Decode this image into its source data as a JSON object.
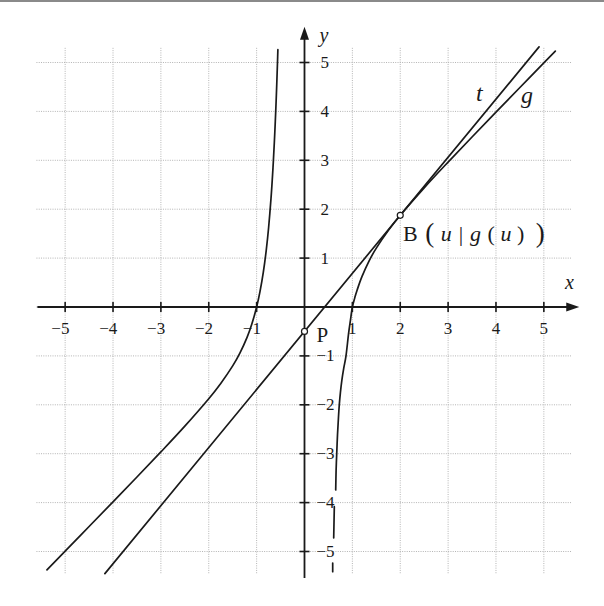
{
  "colors": {
    "ink": "#1a1a1a",
    "grid": "#b4b4b4",
    "background": "#ffffff",
    "border": "#8a8a8a"
  },
  "chart_data": {
    "type": "line",
    "title": "",
    "xlabel": "x",
    "ylabel": "y",
    "xlim": [
      -5.6,
      5.58
    ],
    "ylim": [
      -5.46,
      5.3
    ],
    "grid": true,
    "legend": null,
    "grid_lines": {
      "x": [
        -5,
        -4,
        -3,
        -2,
        -1,
        0,
        1,
        2,
        3,
        4,
        5
      ],
      "y": [
        -5,
        -4,
        -3,
        -2,
        -1,
        0,
        1,
        2,
        3,
        4,
        5
      ]
    },
    "x_axis": {
      "from": -5.58,
      "to": 5.74
    },
    "y_axis": {
      "from": -5.54,
      "to": 5.73
    },
    "x_ticks": {
      "values": [
        -5,
        -4,
        -3,
        -2,
        -1,
        1,
        2,
        3,
        4,
        5
      ],
      "labels": [
        "−5",
        "−4",
        "−3",
        "−2",
        "−1",
        "1",
        "2",
        "3",
        "4",
        "5"
      ]
    },
    "y_ticks": {
      "values": [
        5,
        4,
        3,
        2,
        1,
        -1,
        -2,
        -3,
        -4,
        -5
      ],
      "labels": [
        "5",
        "4",
        "3",
        "2",
        "1",
        "−1",
        "−2",
        "−3",
        "−4",
        "−5"
      ]
    },
    "series": [
      {
        "name": "g",
        "label": "g",
        "style": "solid",
        "branches": [
          [
            [
              -5.38,
              -5.374
            ],
            [
              -5,
              -4.992
            ],
            [
              -4.5,
              -4.489
            ],
            [
              -4,
              -3.984
            ],
            [
              -3.5,
              -3.477
            ],
            [
              -3,
              -2.963
            ],
            [
              -2.5,
              -2.436
            ],
            [
              -2,
              -1.875
            ],
            [
              -1.75,
              -1.563
            ],
            [
              -1.5,
              -1.204
            ],
            [
              -1.35,
              -0.944
            ],
            [
              -1.2,
              -0.621
            ],
            [
              -1.1,
              -0.349
            ],
            [
              -1,
              0
            ],
            [
              -0.93,
              0.313
            ],
            [
              -0.86,
              0.712
            ],
            [
              -0.8,
              1.153
            ],
            [
              -0.75,
              1.62
            ],
            [
              -0.7,
              2.215
            ],
            [
              -0.67,
              2.655
            ],
            [
              -0.65,
              2.991
            ],
            [
              -0.63,
              3.369
            ],
            [
              -0.61,
              3.796
            ],
            [
              -0.595,
              4.152
            ],
            [
              -0.58,
              4.545
            ],
            [
              -0.57,
              4.83
            ],
            [
              -0.562,
              5.072
            ],
            [
              -0.556,
              5.262
            ]
          ],
          [
            [
              0.652,
              -3.74
            ],
            [
              0.66,
              -3.35
            ],
            [
              0.673,
              -3.0
            ],
            [
              0.69,
              -2.6
            ],
            [
              0.71,
              -2.25
            ],
            [
              0.727,
              -2.0
            ],
            [
              0.75,
              -1.75
            ],
            [
              0.78,
              -1.5
            ],
            [
              0.82,
              -1.25
            ],
            [
              0.867,
              -1.0
            ],
            [
              0.92,
              -0.55
            ],
            [
              0.96,
              -0.27
            ],
            [
              1.0,
              0
            ],
            [
              1.05,
              0.187
            ],
            [
              1.1,
              0.349
            ],
            [
              1.2,
              0.621
            ],
            [
              1.35,
              0.944
            ],
            [
              1.5,
              1.204
            ],
            [
              1.75,
              1.563
            ],
            [
              2,
              1.875
            ],
            [
              2.5,
              2.436
            ],
            [
              3,
              2.963
            ],
            [
              3.5,
              3.477
            ],
            [
              4,
              3.984
            ],
            [
              4.5,
              4.489
            ],
            [
              5,
              4.992
            ],
            [
              5.24,
              5.233
            ]
          ],
          [
            [
              0.623,
              -4.084
            ],
            [
              0.61,
              -4.724
            ]
          ],
          [
            [
              0.589,
              -5.235
            ],
            [
              0.589,
              -5.413
            ]
          ]
        ]
      },
      {
        "name": "t",
        "label": "t",
        "style": "solid",
        "branches": [
          [
            [
              -4.17,
              -5.452
            ],
            [
              4.9,
              5.319
            ]
          ]
        ]
      }
    ],
    "points": [
      {
        "name": "B",
        "label": "B(u|g(u))",
        "label_parts": [
          {
            "text": "B"
          },
          {
            "text": "("
          },
          {
            "text": "u"
          },
          {
            "text": "|"
          },
          {
            "text": "g"
          },
          {
            "text": "("
          },
          {
            "text": "u"
          },
          {
            "text": ")"
          },
          {
            "text": ")"
          }
        ],
        "x": 2,
        "y": 1.875,
        "marker": "open-circle"
      },
      {
        "name": "P",
        "label": "P",
        "x": 0,
        "y": -0.5,
        "marker": "open-circle"
      }
    ]
  }
}
